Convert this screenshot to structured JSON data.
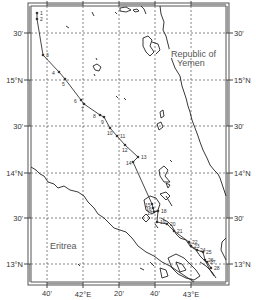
{
  "map": {
    "title": "",
    "frame": {
      "left": 31,
      "top": 6,
      "right": 226,
      "bottom": 282
    },
    "country_labels": [
      {
        "id": "yemen-line1",
        "text": "Republic of",
        "x": 171,
        "y": 57
      },
      {
        "id": "yemen-line2",
        "text": "Yemen",
        "x": 177,
        "y": 66
      },
      {
        "id": "eritrea",
        "text": "Eritrea",
        "x": 50,
        "y": 249
      }
    ],
    "lat_labels_left": [
      {
        "text": "30'",
        "y": 33
      },
      {
        "text": "15°N",
        "y": 80
      },
      {
        "text": "30'",
        "y": 126
      },
      {
        "text": "14°N",
        "y": 173
      },
      {
        "text": "30'",
        "y": 218
      },
      {
        "text": "13°N",
        "y": 264
      }
    ],
    "lat_labels_right": [
      {
        "text": "30'",
        "y": 33
      },
      {
        "text": "15°N",
        "y": 80
      },
      {
        "text": "30'",
        "y": 126
      },
      {
        "text": "14°N",
        "y": 173
      },
      {
        "text": "30'",
        "y": 218
      },
      {
        "text": "13°N",
        "y": 264
      }
    ],
    "lon_labels_bottom": [
      {
        "text": "40'",
        "x": 47
      },
      {
        "text": "42°E",
        "x": 83
      },
      {
        "text": "20'",
        "x": 119
      },
      {
        "text": "40'",
        "x": 155
      },
      {
        "text": "43°E",
        "x": 191
      }
    ],
    "grid": {
      "x": [
        47,
        83,
        119,
        155,
        191
      ],
      "y": [
        33,
        80,
        126,
        173,
        218,
        264
      ]
    }
  },
  "stations": [
    {
      "n": "1",
      "x": 37,
      "y": 13
    },
    {
      "n": "2",
      "x": 37,
      "y": 19
    },
    {
      "n": "3",
      "x": 43,
      "y": 55
    },
    {
      "n": "4",
      "x": 59,
      "y": 72
    },
    {
      "n": "5",
      "x": 65,
      "y": 79
    },
    {
      "n": "6",
      "x": 81,
      "y": 100
    },
    {
      "n": "7",
      "x": 84,
      "y": 104
    },
    {
      "n": "8",
      "x": 100,
      "y": 115
    },
    {
      "n": "9",
      "x": 104,
      "y": 117
    },
    {
      "n": "10",
      "x": 110,
      "y": 128
    },
    {
      "n": "11",
      "x": 117,
      "y": 136
    },
    {
      "n": "12",
      "x": 125,
      "y": 145
    },
    {
      "n": "13",
      "x": 138,
      "y": 157
    },
    {
      "n": "14",
      "x": 133,
      "y": 162
    },
    {
      "n": "15",
      "x": 152,
      "y": 204
    },
    {
      "n": "16",
      "x": 153,
      "y": 208
    },
    {
      "n": "17",
      "x": 154,
      "y": 212
    },
    {
      "n": "18",
      "x": 158,
      "y": 211
    },
    {
      "n": "19",
      "x": 157,
      "y": 222
    },
    {
      "n": "20",
      "x": 167,
      "y": 224
    },
    {
      "n": "21",
      "x": 174,
      "y": 231
    },
    {
      "n": "22",
      "x": 189,
      "y": 242
    },
    {
      "n": "23",
      "x": 191,
      "y": 246
    },
    {
      "n": "24",
      "x": 197,
      "y": 250
    },
    {
      "n": "25",
      "x": 203,
      "y": 252
    },
    {
      "n": "26",
      "x": 205,
      "y": 260
    },
    {
      "n": "27",
      "x": 207,
      "y": 262
    },
    {
      "n": "28",
      "x": 211,
      "y": 268
    }
  ],
  "colors": {
    "frame": "#555555",
    "frame_band": "#9a9a9a",
    "grid": "#666666",
    "coast": "#222222",
    "track": "#333333",
    "station": "#333333",
    "text": "#333333",
    "country_text": "#555555"
  }
}
